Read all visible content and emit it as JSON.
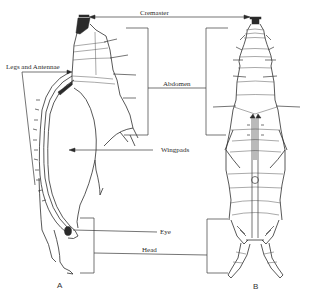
{
  "figure": {
    "type": "scientific-illustration",
    "views": [
      {
        "id": "A",
        "label": "A"
      },
      {
        "id": "B",
        "label": "B"
      }
    ],
    "labels": {
      "cremaster": "Cremaster",
      "abdomen": "Abdomen",
      "legs_antennae": "Legs and Antennae",
      "wingpads": "Wingpads",
      "eye": "Eye",
      "head": "Head"
    },
    "colors": {
      "background": "#ffffff",
      "ink": "#2e2e2e"
    }
  }
}
